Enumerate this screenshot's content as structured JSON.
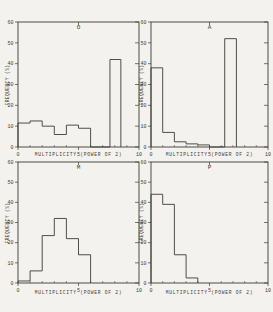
{
  "figure": {
    "ink_color": "#3e3b34",
    "paper_color": "#f3f2ee",
    "x_axis_title": "MULTIPLICITY (POWER OF 2)",
    "y_axis_title": "FREQUENCY (%)",
    "x_tick_labels": [
      "0",
      "5",
      "10"
    ],
    "y_tick_labels": [
      "0",
      "10",
      "20",
      "30",
      "40",
      "50",
      "60"
    ]
  },
  "chart_data": [
    {
      "type": "bar",
      "panel": "top-left",
      "label": "O",
      "xlabel": "MULTIPLICITY (POWER OF 2)",
      "ylabel": "FREQUENCY (%)",
      "xlim": [
        0,
        10
      ],
      "ylim": [
        0,
        60
      ],
      "x_ticks": [
        0,
        5,
        10
      ],
      "y_ticks": [
        0,
        10,
        20,
        30,
        40,
        50,
        60
      ],
      "bins": [
        [
          0,
          1,
          11.5
        ],
        [
          1,
          2,
          12.5
        ],
        [
          2,
          3,
          10
        ],
        [
          3,
          4,
          6
        ],
        [
          4,
          5,
          10.5
        ],
        [
          5,
          6,
          9
        ],
        [
          7.6,
          8.5,
          42
        ]
      ]
    },
    {
      "type": "bar",
      "panel": "top-right",
      "label": "A",
      "xlabel": "MULTIPLICITY (POWER OF 2)",
      "ylabel": "FREQUENCY (%)",
      "xlim": [
        0,
        10
      ],
      "ylim": [
        0,
        60
      ],
      "x_ticks": [
        0,
        5,
        10
      ],
      "y_ticks": [
        0,
        10,
        20,
        30,
        40,
        50,
        60
      ],
      "bins": [
        [
          0,
          1,
          38
        ],
        [
          1,
          2,
          7
        ],
        [
          2,
          3,
          2.5
        ],
        [
          3,
          4,
          1.5
        ],
        [
          4,
          5,
          1
        ],
        [
          6.3,
          7.3,
          52
        ]
      ]
    },
    {
      "type": "bar",
      "panel": "bottom-left",
      "label": "M",
      "xlabel": "MULTIPLICITY (POWER OF 2)",
      "ylabel": "FREQUENCY (%)",
      "xlim": [
        0,
        10
      ],
      "ylim": [
        0,
        60
      ],
      "x_ticks": [
        0,
        5,
        10
      ],
      "y_ticks": [
        0,
        10,
        20,
        30,
        40,
        50,
        60
      ],
      "bins": [
        [
          0,
          1,
          1
        ],
        [
          1,
          2,
          6
        ],
        [
          2,
          3,
          23.5
        ],
        [
          3,
          4,
          32
        ],
        [
          4,
          5,
          22
        ],
        [
          5,
          6,
          14
        ]
      ]
    },
    {
      "type": "bar",
      "panel": "bottom-right",
      "label": "P",
      "xlabel": "MULTIPLICITY (POWER OF 2)",
      "ylabel": "FREQUENCY (%)",
      "xlim": [
        0,
        10
      ],
      "ylim": [
        0,
        60
      ],
      "x_ticks": [
        0,
        5,
        10
      ],
      "y_ticks": [
        0,
        10,
        20,
        30,
        40,
        50,
        60
      ],
      "bins": [
        [
          0,
          1,
          44
        ],
        [
          1,
          2,
          39
        ],
        [
          2,
          3,
          14
        ],
        [
          3,
          4,
          2.5
        ]
      ]
    }
  ]
}
